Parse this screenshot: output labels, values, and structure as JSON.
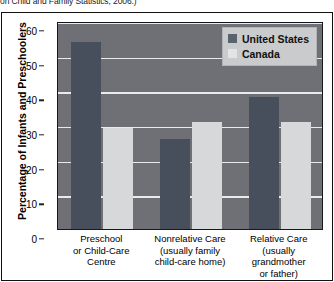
{
  "caption": {
    "text": "on Child and Family Statistics, 2006.)"
  },
  "legend": {
    "items": [
      {
        "label": "United States",
        "swatch": "legend-swatch-united-states",
        "color": "#474f5c"
      },
      {
        "label": "Canada",
        "swatch": "legend-swatch-canada",
        "color": "#d6d8da"
      }
    ]
  },
  "axis": {
    "y_title": "Percentage of Infants and Preschoolers",
    "y_ticks": [
      "60",
      "50",
      "40",
      "30",
      "20",
      "10",
      "0"
    ]
  },
  "categories": [
    "Preschool\nor Child-Care\nCentre",
    "Nonrelative Care\n(usually family\nchild-care home)",
    "Relative Care\n(usually\ngrandmother\nor father)"
  ],
  "chart_data": {
    "type": "bar",
    "title": "",
    "xlabel": "",
    "ylabel": "Percentage of Infants and Preschoolers",
    "ylim": [
      0,
      60
    ],
    "ytick_step": 10,
    "grid": true,
    "legend_position": "top-right",
    "categories": [
      "Preschool or Child-Care Centre",
      "Nonrelative Care (usually family child-care home)",
      "Relative Care (usually grandmother or father)"
    ],
    "series": [
      {
        "name": "United States",
        "color": "#474f5c",
        "values": [
          54,
          26,
          38
        ]
      },
      {
        "name": "Canada",
        "color": "#d6d8da",
        "values": [
          29,
          31,
          31
        ]
      }
    ]
  }
}
